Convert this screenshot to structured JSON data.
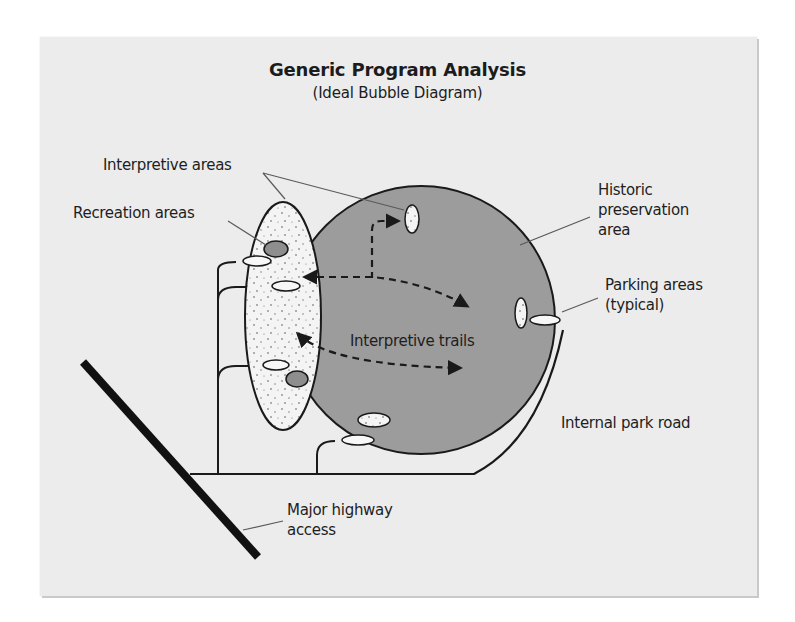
{
  "title": {
    "main": "Generic Program Analysis",
    "subtitle": "(Ideal Bubble Diagram)"
  },
  "labels": {
    "interpretive_areas": "Interpretive areas",
    "recreation_areas": "Recreation areas",
    "historic_preservation": "Historic\npreservation\narea",
    "parking_areas": "Parking areas\n(typical)",
    "interpretive_trails": "Interpretive trails",
    "internal_park_road": "Internal park road",
    "major_highway_access": "Major highway\naccess"
  },
  "colors": {
    "paper": "#ececec",
    "historic_area_fill": "#9c9c9c",
    "interpretive_zone_fill": "#f4f4f4",
    "recreation_fill": "#8e8e8e",
    "parking_fill": "#f7f7f7",
    "line": "#1a1a1a",
    "leader": "#5a5a5a"
  },
  "diagram": {
    "bubbles": [
      {
        "name": "Historic preservation area",
        "shape": "circle"
      },
      {
        "name": "Interpretive zone",
        "shape": "ellipse",
        "texture": "stippled"
      },
      {
        "name": "Recreation areas",
        "count": 2
      },
      {
        "name": "Parking areas",
        "count": 5
      },
      {
        "name": "Interpretive areas",
        "count": 2
      }
    ]
  }
}
